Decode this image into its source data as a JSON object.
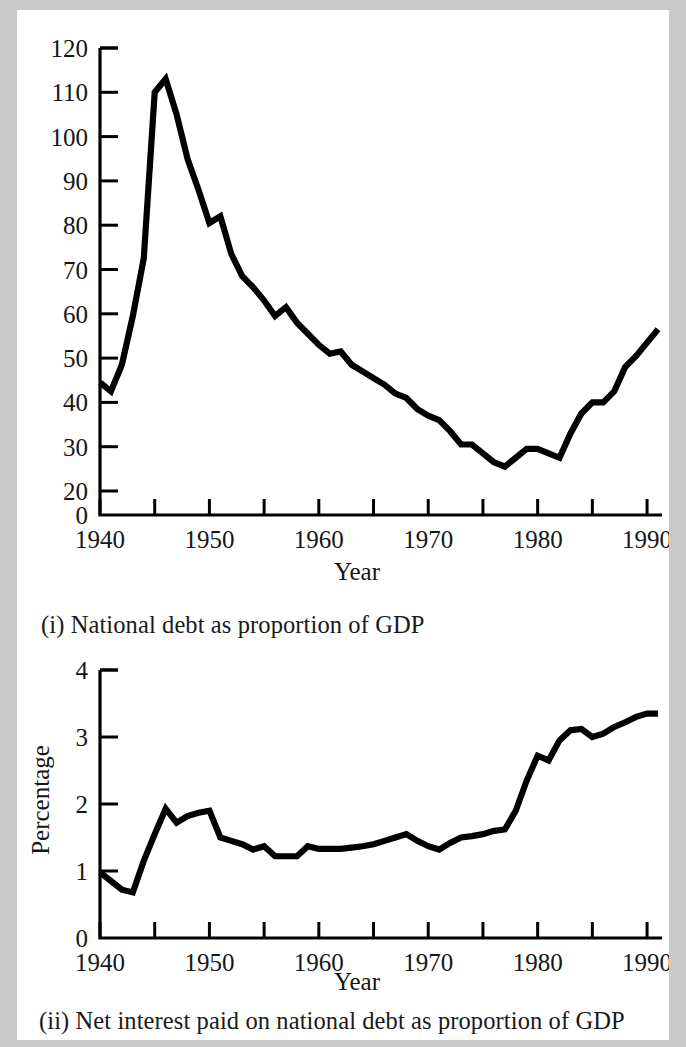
{
  "figure": {
    "background_color": "#ffffff",
    "border_color": "#c9c9c9",
    "line_color": "#000000"
  },
  "panel_i": {
    "caption": "(i) National debt as proportion of GDP",
    "xlabel": "Year",
    "ylabel": "",
    "x_tick_labels": [
      "1940",
      "1950",
      "1960",
      "1970",
      "1980",
      "1990"
    ],
    "y_tick_labels": [
      "0",
      "20",
      "30",
      "40",
      "50",
      "60",
      "70",
      "80",
      "90",
      "100",
      "110",
      "120"
    ]
  },
  "panel_ii": {
    "caption": "(ii) Net interest paid on national debt as proportion of GDP",
    "xlabel": "Year",
    "ylabel": "Percentage",
    "x_tick_labels": [
      "1940",
      "1950",
      "1960",
      "1970",
      "1980",
      "1990"
    ],
    "y_tick_labels": [
      "0",
      "1",
      "2",
      "3",
      "4"
    ]
  },
  "chart_data": [
    {
      "type": "line",
      "title": "(i) National debt as proportion of GDP",
      "xlabel": "Year",
      "ylabel": "",
      "xlim": [
        1940,
        1991
      ],
      "ylim": [
        0,
        120
      ],
      "y_axis_break": "between 0 and 20",
      "grid": false,
      "legend": null,
      "x_major_ticks": [
        1940,
        1950,
        1960,
        1970,
        1980,
        1990
      ],
      "x_minor_ticks": [
        1945,
        1955,
        1965,
        1975,
        1985
      ],
      "y_ticks": [
        0,
        20,
        30,
        40,
        50,
        60,
        70,
        80,
        90,
        100,
        110,
        120
      ],
      "x": [
        1940,
        1941,
        1942,
        1943,
        1944,
        1945,
        1946,
        1947,
        1948,
        1949,
        1950,
        1951,
        1952,
        1953,
        1954,
        1955,
        1956,
        1957,
        1958,
        1959,
        1960,
        1961,
        1962,
        1963,
        1964,
        1965,
        1966,
        1967,
        1968,
        1969,
        1970,
        1971,
        1972,
        1973,
        1974,
        1975,
        1976,
        1977,
        1978,
        1979,
        1980,
        1981,
        1982,
        1983,
        1984,
        1985,
        1986,
        1987,
        1988,
        1989,
        1990,
        1991
      ],
      "values": [
        44.5,
        42.5,
        48.5,
        59.5,
        72.5,
        110.0,
        113.0,
        105.0,
        95.0,
        88.0,
        80.5,
        82.0,
        73.5,
        68.5,
        66.0,
        63.0,
        59.5,
        61.5,
        58.0,
        55.5,
        53.0,
        51.0,
        51.5,
        48.5,
        47.0,
        45.5,
        44.0,
        42.0,
        41.0,
        38.5,
        37.0,
        36.0,
        33.5,
        30.5,
        30.5,
        28.5,
        26.5,
        25.5,
        27.5,
        29.5,
        29.5,
        28.5,
        27.5,
        33.0,
        37.5,
        40.0,
        40.0,
        42.5,
        48.0,
        50.5,
        53.5,
        56.5,
        60.0,
        63.5
      ]
    },
    {
      "type": "line",
      "title": "(ii) Net interest paid on national debt as proportion of GDP",
      "xlabel": "Year",
      "ylabel": "Percentage",
      "xlim": [
        1940,
        1991
      ],
      "ylim": [
        0,
        4
      ],
      "grid": false,
      "legend": null,
      "x_major_ticks": [
        1940,
        1950,
        1960,
        1970,
        1980,
        1990
      ],
      "x_minor_ticks": [
        1945,
        1955,
        1965,
        1975,
        1985
      ],
      "y_ticks": [
        0,
        1,
        2,
        3,
        4
      ],
      "x": [
        1940,
        1941,
        1942,
        1943,
        1944,
        1945,
        1946,
        1947,
        1948,
        1949,
        1950,
        1951,
        1952,
        1953,
        1954,
        1955,
        1956,
        1957,
        1958,
        1959,
        1960,
        1961,
        1962,
        1963,
        1964,
        1965,
        1966,
        1967,
        1968,
        1969,
        1970,
        1971,
        1972,
        1973,
        1974,
        1975,
        1976,
        1977,
        1978,
        1979,
        1980,
        1981,
        1982,
        1983,
        1984,
        1985,
        1986,
        1987,
        1988,
        1989,
        1990,
        1991
      ],
      "values": [
        0.98,
        0.85,
        0.72,
        0.68,
        1.15,
        1.55,
        1.93,
        1.72,
        1.82,
        1.87,
        1.9,
        1.5,
        1.45,
        1.4,
        1.32,
        1.37,
        1.22,
        1.22,
        1.22,
        1.37,
        1.33,
        1.33,
        1.33,
        1.35,
        1.37,
        1.4,
        1.45,
        1.5,
        1.55,
        1.45,
        1.37,
        1.32,
        1.42,
        1.5,
        1.52,
        1.55,
        1.6,
        1.62,
        1.9,
        2.35,
        2.72,
        2.65,
        2.95,
        3.1,
        3.12,
        3.0,
        3.05,
        3.15,
        3.22,
        3.3,
        3.35,
        3.35
      ]
    }
  ]
}
